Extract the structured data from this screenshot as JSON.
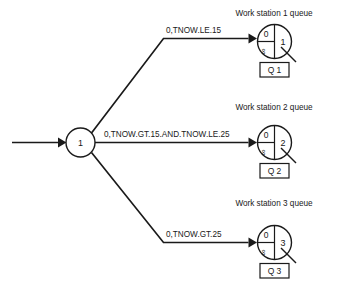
{
  "diagram": {
    "type": "simulation-network-diagram",
    "source_node": {
      "label": "1",
      "name": "branch-node"
    },
    "entry_arrow": {
      "name": "entry-arrow"
    },
    "branches": [
      {
        "id": "branch-1",
        "condition_label": "0,TNOW.LE.15"
      },
      {
        "id": "branch-2",
        "condition_label": "0,TNOW.GT.15.AND.TNOW.LE.25"
      },
      {
        "id": "branch-3",
        "condition_label": "0,TNOW.GT.25"
      }
    ],
    "queues": [
      {
        "id": "queue-1",
        "title": "Work station 1 queue",
        "initial_count": "0",
        "capacity": "∞",
        "server_number": "1",
        "box_label": "Q 1"
      },
      {
        "id": "queue-2",
        "title": "Work station 2 queue",
        "initial_count": "0",
        "capacity": "∞",
        "server_number": "2",
        "box_label": "Q 2"
      },
      {
        "id": "queue-3",
        "title": "Work station 3 queue",
        "initial_count": "0",
        "capacity": "∞",
        "server_number": "3",
        "box_label": "Q 3"
      }
    ],
    "colors": {
      "line": "#1a1a1a",
      "background": "#ffffff",
      "text": "#1a1a1a"
    }
  }
}
